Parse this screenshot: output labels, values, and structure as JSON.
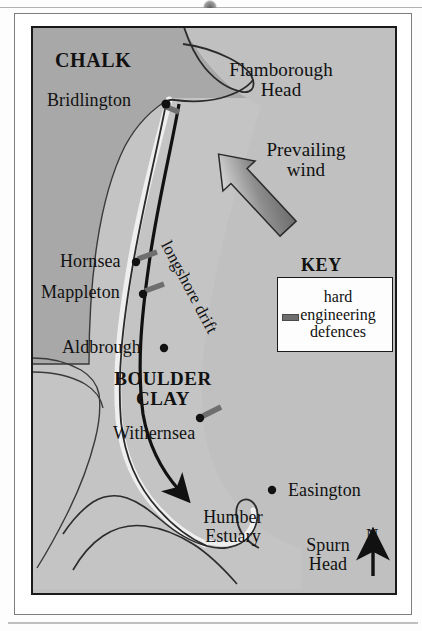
{
  "figure": {
    "map_background_color": "#c0c0c0",
    "chalk_fill_color": "#a8a8a8",
    "boulder_clay_fill_color": "#c4c4c4",
    "coast_line_color": "#2b2b2b",
    "beach_color": "#efefef",
    "defence_marker_color": "#6e6e6e",
    "drift_arrow_color": "#111111"
  },
  "geology": {
    "chalk_label": "CHALK",
    "boulder_clay_label": "BOULDER\nCLAY"
  },
  "settlements": [
    {
      "name": "Bridlington",
      "label_x": 14,
      "label_y": 63,
      "dot_x": 133,
      "dot_y": 76,
      "has_defences": true
    },
    {
      "name": "Hornsea",
      "label_x": 27,
      "label_y": 224,
      "dot_x": 103,
      "dot_y": 234,
      "has_defences": true
    },
    {
      "name": "Mappleton",
      "label_x": 8,
      "label_y": 255,
      "dot_x": 110,
      "dot_y": 266,
      "has_defences": true
    },
    {
      "name": "Aldbrough",
      "label_x": 29,
      "label_y": 310,
      "dot_x": 131,
      "dot_y": 320,
      "has_defences": false
    },
    {
      "name": "Withernsea",
      "label_x": 80,
      "label_y": 396,
      "dot_x": 167,
      "dot_y": 390,
      "has_defences": true
    },
    {
      "name": "Easington",
      "label_x": 255,
      "label_y": 453,
      "dot_x": 239,
      "dot_y": 462,
      "has_defences": false
    }
  ],
  "features": [
    {
      "name": "Flamborough Head",
      "label": "Flamborough\nHead"
    },
    {
      "name": "Humber Estuary",
      "label": "Humber\nEstuary"
    },
    {
      "name": "Spurn Head",
      "label": "Spurn\nHead"
    }
  ],
  "labels": {
    "flamborough_head": "Flamborough\nHead",
    "humber_estuary": "Humber\nEstuary",
    "spurn_head": "Spurn\nHead",
    "prevailing_wind": "Prevailing\nwind",
    "longshore_drift": "longshore drift"
  },
  "key": {
    "title": "KEY",
    "entry_line_1": "hard",
    "entry_line_2": "engineering",
    "entry_line_3": "defences",
    "symbol": "grey-dash"
  },
  "compass": {
    "north_label": "N",
    "direction": "up"
  },
  "wind_arrow": {
    "label": "Prevailing wind",
    "direction": "from north-east to south-west",
    "gradient_from": "#6a6a6a",
    "gradient_to": "#f2f2f2"
  }
}
